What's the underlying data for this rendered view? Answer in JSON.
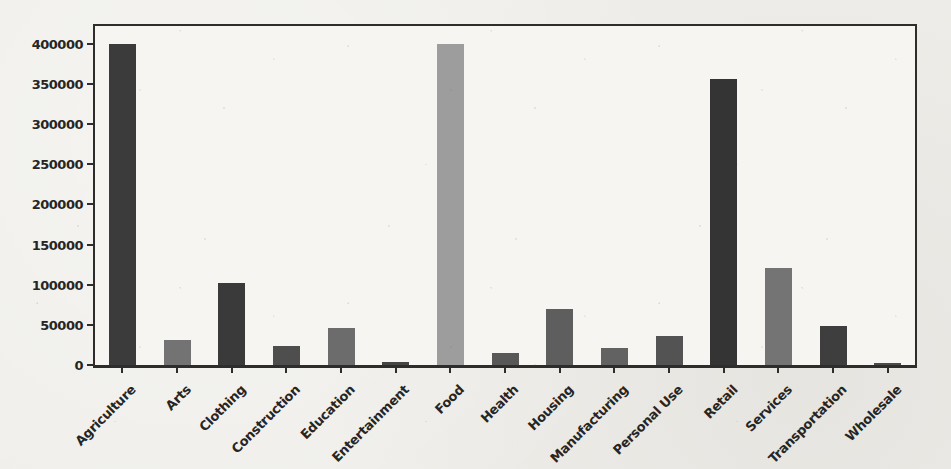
{
  "page": {
    "background_color": "#efeeea",
    "plot_background_color": "#f6f5f1",
    "spine_color": "#2f2d2b",
    "text_color": "#262523"
  },
  "chart_data": {
    "type": "bar",
    "title": "",
    "subtitle": "",
    "xlabel": "",
    "ylabel": "",
    "legend": null,
    "grid": false,
    "x_label_rotation_deg": 45,
    "categories": [
      "Agriculture",
      "Arts",
      "Clothing",
      "Construction",
      "Education",
      "Entertainment",
      "Food",
      "Health",
      "Housing",
      "Manufacturing",
      "Personal Use",
      "Retail",
      "Services",
      "Transportation",
      "Wholesale"
    ],
    "values": [
      400000,
      31000,
      102000,
      24000,
      46000,
      3500,
      400000,
      15000,
      70000,
      21000,
      36500,
      356000,
      121000,
      48000,
      2500
    ],
    "bar_colors": [
      "#3b3b3b",
      "#737373",
      "#3a3a3a",
      "#4e4e4e",
      "#6c6c6c",
      "#454545",
      "#9d9d9d",
      "#585858",
      "#5e5e5e",
      "#626262",
      "#535353",
      "#343434",
      "#747474",
      "#3e3e3e",
      "#4b4b4b"
    ],
    "yticks": [
      0,
      50000,
      100000,
      150000,
      200000,
      250000,
      300000,
      350000,
      400000
    ],
    "ytick_labels": [
      "0",
      "50000",
      "100000",
      "150000",
      "200000",
      "250000",
      "300000",
      "350000",
      "400000"
    ],
    "ylim": [
      0,
      422000
    ],
    "bar_width_px": 27
  }
}
